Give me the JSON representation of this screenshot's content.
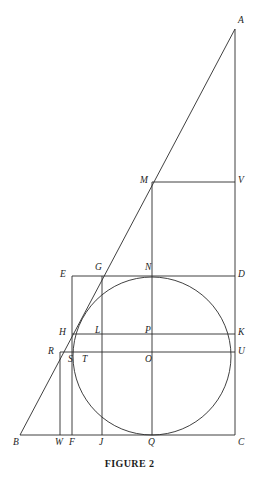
{
  "figure": {
    "caption": "FIGURE 2",
    "stroke_color": "#2b2b2b",
    "background_color": "#ffffff",
    "label_color": "#1d1d1d"
  },
  "points": {
    "A": {
      "label": "A",
      "x": 235,
      "y": 29,
      "lx": 238,
      "ly": 16
    },
    "B": {
      "label": "B",
      "x": 20,
      "y": 435,
      "lx": 13,
      "ly": 438
    },
    "C": {
      "label": "C",
      "x": 235,
      "y": 435,
      "lx": 238,
      "ly": 438
    },
    "D": {
      "label": "D",
      "x": 235,
      "y": 276,
      "lx": 238,
      "ly": 270
    },
    "E": {
      "label": "E",
      "x": 72,
      "y": 276,
      "lx": 60,
      "ly": 270
    },
    "F": {
      "label": "F",
      "x": 72,
      "y": 435,
      "lx": 69,
      "ly": 438
    },
    "G": {
      "label": "G",
      "x": 102,
      "y": 276,
      "lx": 95,
      "ly": 263
    },
    "H": {
      "label": "H",
      "x": 72,
      "y": 334,
      "lx": 59,
      "ly": 328
    },
    "J": {
      "label": "J",
      "x": 102,
      "y": 435,
      "lx": 99,
      "ly": 438
    },
    "K": {
      "label": "K",
      "x": 235,
      "y": 334,
      "lx": 238,
      "ly": 328
    },
    "L": {
      "label": "L",
      "x": 102,
      "y": 334,
      "lx": 95,
      "ly": 326
    },
    "M": {
      "label": "M",
      "x": 152,
      "y": 182,
      "lx": 140,
      "ly": 176
    },
    "N": {
      "label": "N",
      "x": 152,
      "y": 276,
      "lx": 145,
      "ly": 263
    },
    "O": {
      "label": "O",
      "x": 152,
      "y": 352,
      "lx": 145,
      "ly": 355
    },
    "P": {
      "label": "P",
      "x": 152,
      "y": 334,
      "lx": 145,
      "ly": 326
    },
    "Q": {
      "label": "Q",
      "x": 152,
      "y": 435,
      "lx": 148,
      "ly": 438
    },
    "R": {
      "label": "R",
      "x": 60,
      "y": 352,
      "lx": 48,
      "ly": 347
    },
    "S": {
      "label": "S",
      "x": 72,
      "y": 352,
      "lx": 68,
      "ly": 355
    },
    "T": {
      "label": "T",
      "x": 85,
      "y": 352,
      "lx": 82,
      "ly": 355
    },
    "U": {
      "label": "U",
      "x": 235,
      "y": 352,
      "lx": 238,
      "ly": 347
    },
    "V": {
      "label": "V",
      "x": 235,
      "y": 182,
      "lx": 238,
      "ly": 176
    },
    "W": {
      "label": "W",
      "x": 60,
      "y": 435,
      "lx": 55,
      "ly": 438
    }
  },
  "circle": {
    "name": "inscribed-circle",
    "cx": 152,
    "cy": 356,
    "r": 79
  },
  "segments": [
    {
      "name": "segment-BA-hypotenuse",
      "x1": 20,
      "y1": 435,
      "x2": 235,
      "y2": 29
    },
    {
      "name": "segment-AC-vertical",
      "x1": 235,
      "y1": 29,
      "x2": 235,
      "y2": 435
    },
    {
      "name": "segment-BC-base",
      "x1": 20,
      "y1": 435,
      "x2": 235,
      "y2": 435
    },
    {
      "name": "segment-MV",
      "x1": 152,
      "y1": 182,
      "x2": 235,
      "y2": 182
    },
    {
      "name": "segment-MQ-vertical",
      "x1": 152,
      "y1": 182,
      "x2": 152,
      "y2": 435
    },
    {
      "name": "segment-ED",
      "x1": 72,
      "y1": 276,
      "x2": 235,
      "y2": 276
    },
    {
      "name": "segment-EF-vertical",
      "x1": 72,
      "y1": 276,
      "x2": 72,
      "y2": 435
    },
    {
      "name": "segment-GJ-vertical",
      "x1": 102,
      "y1": 276,
      "x2": 102,
      "y2": 435
    },
    {
      "name": "segment-HK",
      "x1": 72,
      "y1": 334,
      "x2": 235,
      "y2": 334
    },
    {
      "name": "segment-RU",
      "x1": 60,
      "y1": 352,
      "x2": 235,
      "y2": 352
    },
    {
      "name": "segment-RW-vertical",
      "x1": 60,
      "y1": 352,
      "x2": 60,
      "y2": 435
    }
  ]
}
